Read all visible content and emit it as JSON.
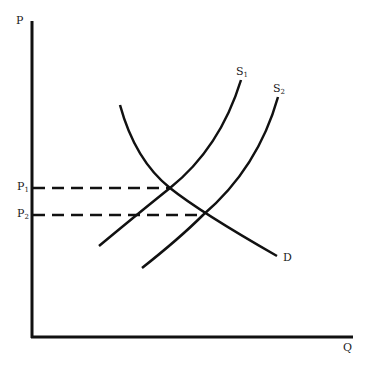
{
  "diagram": {
    "type": "supply-demand",
    "axes": {
      "y_label": "P",
      "x_label": "Q"
    },
    "curves": [
      {
        "id": "S1",
        "label": "S",
        "sub": "1",
        "kind": "supply"
      },
      {
        "id": "S2",
        "label": "S",
        "sub": "2",
        "kind": "supply"
      },
      {
        "id": "D",
        "label": "D",
        "kind": "demand"
      }
    ],
    "price_levels": [
      {
        "label": "P",
        "sub": "1",
        "meaning": "equilibrium price with S1"
      },
      {
        "label": "P",
        "sub": "2",
        "meaning": "equilibrium price with S2"
      }
    ],
    "line_color": "#111111"
  }
}
